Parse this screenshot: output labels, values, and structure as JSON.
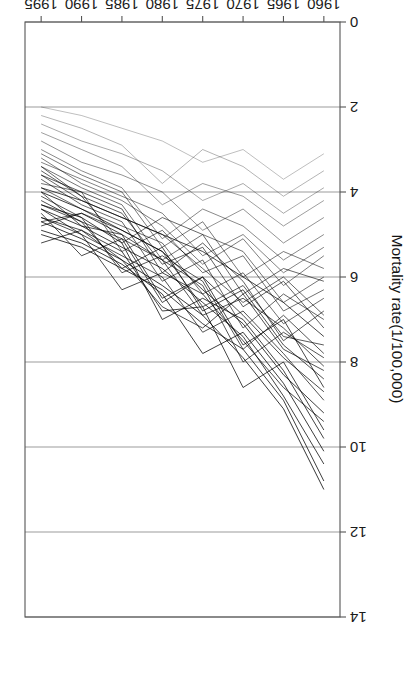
{
  "figure": {
    "rotation_degrees": 180,
    "background": "#ffffff",
    "ink_color": "#1a1a1a",
    "axis_color": "#555555",
    "grid_color": "#707070"
  },
  "chart_data": {
    "type": "line",
    "title": "",
    "xlabel": "year",
    "ylabel": "Mortality rate(1/100,000)",
    "xlim": [
      1958,
      1997
    ],
    "ylim": [
      0,
      14
    ],
    "xticks": [
      1960,
      1965,
      1970,
      1975,
      1980,
      1985,
      1990,
      1995
    ],
    "xtick_labels": [
      "1960",
      "1965",
      "1970",
      "1975",
      "1980",
      "1985",
      "1990",
      "1995"
    ],
    "yticks": [
      0,
      2,
      4,
      6,
      8,
      10,
      12,
      14
    ],
    "ytick_labels": [
      "0",
      "2",
      "4",
      "6",
      "8",
      "10",
      "12",
      "14"
    ],
    "grid": "horizontal-gridlines-at-yticks",
    "legend": "none",
    "x": [
      1960,
      1965,
      1970,
      1975,
      1980,
      1985,
      1990,
      1995
    ],
    "series": [
      {
        "name": "s01",
        "opacity": 0.85,
        "values": [
          7.4,
          6.6,
          6.0,
          5.4,
          5.0,
          4.6,
          4.2,
          3.9
        ]
      },
      {
        "name": "s02",
        "opacity": 0.8,
        "values": [
          8.1,
          7.2,
          6.5,
          6.9,
          5.6,
          5.1,
          4.7,
          4.3
        ]
      },
      {
        "name": "s03",
        "opacity": 0.75,
        "values": [
          6.8,
          7.5,
          6.1,
          5.2,
          5.9,
          4.4,
          4.0,
          3.6
        ]
      },
      {
        "name": "s04",
        "opacity": 0.9,
        "values": [
          9.2,
          8.3,
          7.1,
          6.3,
          5.4,
          4.9,
          4.4,
          4.0
        ]
      },
      {
        "name": "s05",
        "opacity": 0.7,
        "values": [
          6.1,
          5.8,
          6.4,
          5.0,
          4.6,
          5.2,
          4.1,
          3.4
        ]
      },
      {
        "name": "s06",
        "opacity": 0.85,
        "values": [
          8.6,
          7.0,
          7.6,
          6.0,
          6.5,
          5.0,
          4.5,
          4.8
        ]
      },
      {
        "name": "s07",
        "opacity": 0.6,
        "values": [
          5.5,
          6.2,
          5.1,
          5.7,
          4.8,
          4.2,
          3.8,
          3.2
        ]
      },
      {
        "name": "s08",
        "opacity": 0.88,
        "values": [
          10.4,
          8.8,
          7.4,
          6.6,
          5.8,
          5.3,
          4.8,
          4.4
        ]
      },
      {
        "name": "s09",
        "opacity": 0.72,
        "values": [
          7.0,
          6.4,
          7.2,
          5.6,
          6.1,
          4.7,
          4.3,
          3.7
        ]
      },
      {
        "name": "s10",
        "opacity": 0.8,
        "values": [
          8.9,
          7.8,
          6.8,
          7.3,
          6.0,
          5.5,
          5.0,
          4.6
        ]
      },
      {
        "name": "s11",
        "opacity": 0.55,
        "values": [
          5.0,
          5.6,
          4.8,
          4.4,
          5.1,
          3.9,
          3.5,
          3.0
        ]
      },
      {
        "name": "s12",
        "opacity": 0.92,
        "values": [
          11.0,
          9.1,
          7.9,
          6.9,
          6.2,
          5.6,
          5.1,
          4.7
        ]
      },
      {
        "name": "s13",
        "opacity": 0.68,
        "values": [
          6.5,
          7.1,
          5.9,
          6.4,
          5.2,
          4.8,
          4.4,
          3.9
        ]
      },
      {
        "name": "s14",
        "opacity": 0.78,
        "values": [
          7.8,
          6.9,
          7.7,
          6.1,
          5.5,
          5.9,
          4.6,
          4.1
        ]
      },
      {
        "name": "s15",
        "opacity": 0.5,
        "values": [
          4.6,
          5.2,
          4.4,
          4.9,
          4.0,
          3.6,
          3.3,
          2.8
        ]
      },
      {
        "name": "s16",
        "opacity": 0.86,
        "values": [
          9.6,
          8.0,
          8.6,
          6.7,
          6.8,
          5.4,
          4.9,
          5.2
        ]
      },
      {
        "name": "s17",
        "opacity": 0.74,
        "values": [
          7.2,
          6.1,
          6.7,
          5.3,
          5.7,
          4.5,
          4.1,
          3.5
        ]
      },
      {
        "name": "s18",
        "opacity": 0.82,
        "values": [
          8.4,
          7.6,
          6.3,
          6.8,
          5.3,
          5.8,
          4.7,
          4.2
        ]
      },
      {
        "name": "s19",
        "opacity": 0.45,
        "values": [
          4.2,
          4.8,
          4.1,
          3.8,
          4.3,
          3.4,
          3.0,
          2.6
        ]
      },
      {
        "name": "s20",
        "opacity": 0.9,
        "values": [
          10.1,
          8.5,
          7.3,
          7.8,
          6.4,
          5.7,
          5.2,
          4.9
        ]
      },
      {
        "name": "s21",
        "opacity": 0.66,
        "values": [
          6.3,
          6.8,
          5.5,
          5.9,
          4.9,
          5.4,
          4.0,
          3.8
        ]
      },
      {
        "name": "s22",
        "opacity": 0.79,
        "values": [
          7.9,
          7.3,
          8.0,
          6.2,
          5.6,
          5.0,
          4.8,
          4.0
        ]
      },
      {
        "name": "s23",
        "opacity": 0.58,
        "values": [
          5.3,
          5.9,
          5.0,
          5.5,
          4.5,
          4.1,
          3.7,
          3.3
        ]
      },
      {
        "name": "s24",
        "opacity": 0.87,
        "values": [
          9.8,
          8.2,
          7.0,
          6.5,
          7.0,
          5.2,
          4.6,
          4.3
        ]
      },
      {
        "name": "s25",
        "opacity": 0.7,
        "values": [
          6.9,
          6.0,
          6.6,
          5.8,
          5.0,
          4.6,
          4.2,
          3.6
        ]
      },
      {
        "name": "s26",
        "opacity": 0.83,
        "values": [
          8.7,
          7.9,
          6.9,
          6.0,
          6.6,
          5.1,
          5.5,
          4.5
        ]
      },
      {
        "name": "s27",
        "opacity": 0.4,
        "values": [
          3.9,
          4.5,
          3.8,
          4.2,
          3.5,
          3.1,
          2.8,
          2.4
        ]
      },
      {
        "name": "s28",
        "opacity": 0.89,
        "values": [
          10.8,
          8.9,
          7.7,
          7.1,
          6.3,
          5.8,
          5.3,
          5.0
        ]
      },
      {
        "name": "s29",
        "opacity": 0.64,
        "values": [
          6.0,
          6.6,
          5.4,
          5.0,
          5.6,
          4.3,
          3.9,
          3.4
        ]
      },
      {
        "name": "s30",
        "opacity": 0.76,
        "values": [
          7.6,
          7.4,
          6.2,
          6.7,
          5.4,
          4.9,
          4.5,
          4.7
        ]
      },
      {
        "name": "s31",
        "opacity": 0.35,
        "values": [
          3.5,
          4.1,
          3.4,
          3.0,
          3.8,
          2.9,
          2.5,
          2.2
        ]
      },
      {
        "name": "s32",
        "opacity": 0.84,
        "values": [
          9.4,
          8.6,
          7.5,
          6.4,
          5.9,
          6.3,
          5.0,
          4.4
        ]
      },
      {
        "name": "s33",
        "opacity": 0.62,
        "values": [
          5.8,
          5.4,
          6.0,
          4.7,
          5.3,
          4.0,
          3.6,
          3.1
        ]
      },
      {
        "name": "s34",
        "opacity": 0.81,
        "values": [
          8.2,
          7.7,
          6.4,
          7.2,
          6.7,
          5.6,
          4.9,
          4.6
        ]
      },
      {
        "name": "s35",
        "opacity": 0.3,
        "values": [
          3.1,
          3.7,
          3.0,
          3.3,
          2.8,
          2.5,
          2.2,
          2.0
        ]
      }
    ]
  }
}
